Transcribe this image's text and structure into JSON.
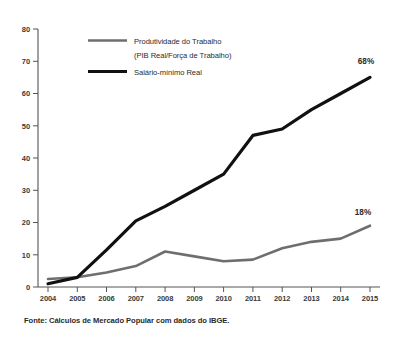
{
  "chart_data": {
    "type": "line",
    "title": "",
    "subtitle": "",
    "xlabel": "",
    "ylabel": "",
    "x": [
      2004,
      2005,
      2006,
      2007,
      2008,
      2009,
      2010,
      2011,
      2012,
      2013,
      2014,
      2015
    ],
    "categories": [
      "2004",
      "2005",
      "2006",
      "2007",
      "2008",
      "2009",
      "2010",
      "2011",
      "2012",
      "2013",
      "2014",
      "2015"
    ],
    "xlim": [
      2004,
      2015
    ],
    "ylim": [
      0,
      80
    ],
    "yticks": [
      0,
      10,
      20,
      30,
      40,
      50,
      60,
      70,
      80
    ],
    "ytick_labels": [
      "0",
      "10",
      "20",
      "30",
      "40",
      "50",
      "60",
      "70",
      "80"
    ],
    "grid": false,
    "legend_position": "top-left-inside",
    "series": [
      {
        "name": "Produtividade do Trabalho (PIB Real/Força de Trabalho)",
        "color": "#6e6e6e",
        "width": 2.6,
        "values": [
          2.5,
          3.0,
          4.5,
          6.5,
          11.0,
          9.5,
          8.0,
          8.5,
          12.0,
          14.0,
          15.0,
          19.0
        ],
        "end_label": "18%"
      },
      {
        "name": "Salário-mínimo Real",
        "color": "#111111",
        "width": 3.2,
        "values": [
          1.0,
          3.0,
          11.5,
          20.5,
          25.0,
          30.0,
          35.0,
          47.0,
          49.0,
          55.0,
          60.0,
          65.0
        ],
        "end_label": "68%"
      }
    ],
    "annotations": [
      {
        "text": "68%",
        "x": 2015,
        "y": 68,
        "series": "Salário-mínimo Real"
      },
      {
        "text": "18%",
        "x": 2015,
        "y": 22,
        "series": "Produtividade do Trabalho (PIB Real/Força de Trabalho)"
      }
    ],
    "legend": [
      {
        "label_line1": "Produtividade do Trabalho",
        "label_line2": "(PIB Real/Força de Trabalho)",
        "color": "#6e6e6e"
      },
      {
        "label_line1": "Salário-mínimo Real",
        "label_line2": "",
        "color": "#111111"
      }
    ],
    "source": "Fonte: Cálculos de Mercado Popular com dados do IBGE."
  },
  "legend": {
    "item1_line1": "Produtividade do Trabalho",
    "item1_line2": "(PIB Real/Força de Trabalho)",
    "item2_line1": "Salário-mínimo Real"
  },
  "annotations": {
    "wage_end": "68%",
    "productivity_end": "18%"
  },
  "axis": {
    "y": {
      "t0": "0",
      "t1": "10",
      "t2": "20",
      "t3": "30",
      "t4": "40",
      "t5": "50",
      "t6": "60",
      "t7": "70",
      "t8": "80"
    },
    "x": {
      "t0": "2004",
      "t1": "2005",
      "t2": "2006",
      "t3": "2007",
      "t4": "2008",
      "t5": "2009",
      "t6": "2010",
      "t7": "2011",
      "t8": "2012",
      "t9": "2013",
      "t10": "2014",
      "t11": "2015"
    }
  },
  "footer": {
    "source": "Fonte: Cálculos de Mercado Popular com dados do IBGE."
  },
  "colors": {
    "productivity": "#6e6e6e",
    "wage": "#111111",
    "axis": "#555555",
    "text": "#2b2b2b",
    "background": "#ffffff"
  }
}
